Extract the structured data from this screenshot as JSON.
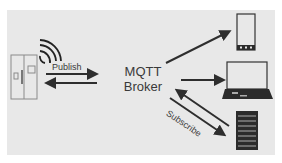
{
  "diagram": {
    "broker": {
      "line1": "MQTT",
      "line2": "Broker"
    },
    "publish_label": "Publish",
    "subscribe_label": "Subscribe",
    "publisher": {
      "icon": "refrigerator-icon",
      "signal": "wifi-signal-icon"
    },
    "subscribers": [
      {
        "icon": "smartphone-icon"
      },
      {
        "icon": "laptop-icon"
      },
      {
        "icon": "server-icon"
      }
    ],
    "colors": {
      "panel": "#e8e8e8",
      "stroke": "#333333",
      "device_fill": "#2b2b2b"
    }
  }
}
